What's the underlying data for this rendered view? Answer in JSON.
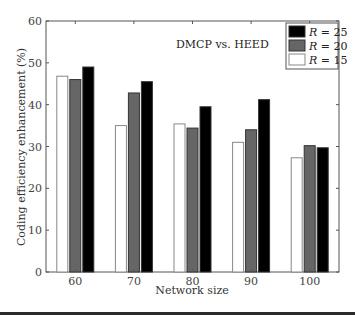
{
  "chart_data": {
    "type": "bar",
    "title": "",
    "annotation": "DMCP vs. HEED",
    "xlabel": "Network size",
    "ylabel": "Coding efficiency enhancement (%)",
    "categories": [
      "60",
      "70",
      "80",
      "90",
      "100"
    ],
    "ylim": [
      0,
      60
    ],
    "yticks": [
      0,
      10,
      20,
      30,
      40,
      50,
      60
    ],
    "grid": false,
    "legend_position": "upper right",
    "series": [
      {
        "name": "R = 15",
        "var": "R",
        "eq": " = 15",
        "color": "#ffffff",
        "values": [
          46.8,
          35.0,
          35.4,
          31.0,
          27.3
        ]
      },
      {
        "name": "R = 20",
        "var": "R",
        "eq": " = 20",
        "color": "#666666",
        "values": [
          46.0,
          42.8,
          34.4,
          34.0,
          30.2
        ]
      },
      {
        "name": "R = 25",
        "var": "R",
        "eq": " = 25",
        "color": "#000000",
        "values": [
          49.0,
          45.5,
          39.5,
          41.2,
          29.7
        ]
      }
    ],
    "legend_order": [
      "R = 25",
      "R = 20",
      "R = 15"
    ]
  }
}
